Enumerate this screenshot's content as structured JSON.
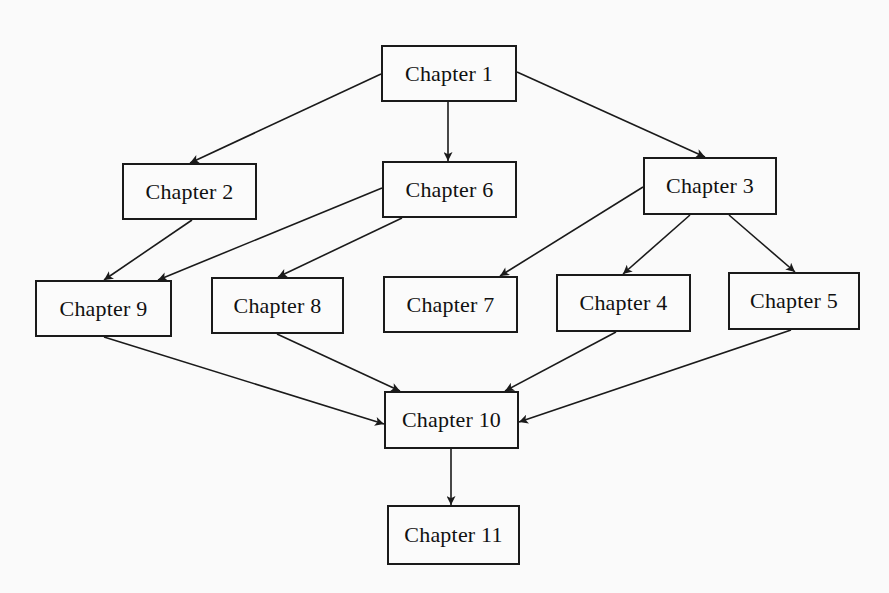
{
  "diagram": {
    "type": "dependency-graph",
    "colors": {
      "background": "#fafafa",
      "stroke": "#1a1a1a",
      "text": "#111111"
    },
    "nodes": [
      {
        "id": "ch1",
        "label": "Chapter 1",
        "x": 381,
        "y": 45,
        "w": 136,
        "h": 57
      },
      {
        "id": "ch2",
        "label": "Chapter 2",
        "x": 122,
        "y": 163,
        "w": 135,
        "h": 57
      },
      {
        "id": "ch6",
        "label": "Chapter 6",
        "x": 382,
        "y": 161,
        "w": 135,
        "h": 57
      },
      {
        "id": "ch3",
        "label": "Chapter 3",
        "x": 643,
        "y": 157,
        "w": 134,
        "h": 58
      },
      {
        "id": "ch9",
        "label": "Chapter 9",
        "x": 35,
        "y": 280,
        "w": 137,
        "h": 57
      },
      {
        "id": "ch8",
        "label": "Chapter 8",
        "x": 211,
        "y": 277,
        "w": 133,
        "h": 57
      },
      {
        "id": "ch7",
        "label": "Chapter 7",
        "x": 383,
        "y": 276,
        "w": 135,
        "h": 57
      },
      {
        "id": "ch4",
        "label": "Chapter 4",
        "x": 556,
        "y": 274,
        "w": 135,
        "h": 58
      },
      {
        "id": "ch5",
        "label": "Chapter 5",
        "x": 728,
        "y": 272,
        "w": 132,
        "h": 58
      },
      {
        "id": "ch10",
        "label": "Chapter 10",
        "x": 384,
        "y": 391,
        "w": 135,
        "h": 58
      },
      {
        "id": "ch11",
        "label": "Chapter 11",
        "x": 387,
        "y": 505,
        "w": 133,
        "h": 60
      }
    ],
    "edges": [
      {
        "from": "ch1",
        "to": "ch2",
        "x1": 381,
        "y1": 74,
        "x2": 190,
        "y2": 163
      },
      {
        "from": "ch1",
        "to": "ch6",
        "x1": 448,
        "y1": 102,
        "x2": 448,
        "y2": 161
      },
      {
        "from": "ch1",
        "to": "ch3",
        "x1": 517,
        "y1": 72,
        "x2": 705,
        "y2": 157
      },
      {
        "from": "ch2",
        "to": "ch9",
        "x1": 192,
        "y1": 220,
        "x2": 104,
        "y2": 280
      },
      {
        "from": "ch6",
        "to": "ch9",
        "x1": 382,
        "y1": 188,
        "x2": 158,
        "y2": 280
      },
      {
        "from": "ch6",
        "to": "ch8",
        "x1": 402,
        "y1": 218,
        "x2": 278,
        "y2": 277
      },
      {
        "from": "ch3",
        "to": "ch7",
        "x1": 643,
        "y1": 187,
        "x2": 500,
        "y2": 276
      },
      {
        "from": "ch3",
        "to": "ch4",
        "x1": 690,
        "y1": 215,
        "x2": 623,
        "y2": 274
      },
      {
        "from": "ch3",
        "to": "ch5",
        "x1": 729,
        "y1": 215,
        "x2": 795,
        "y2": 272
      },
      {
        "from": "ch9",
        "to": "ch10",
        "x1": 104,
        "y1": 337,
        "x2": 384,
        "y2": 424
      },
      {
        "from": "ch8",
        "to": "ch10",
        "x1": 277,
        "y1": 334,
        "x2": 400,
        "y2": 391
      },
      {
        "from": "ch4",
        "to": "ch10",
        "x1": 616,
        "y1": 332,
        "x2": 505,
        "y2": 391
      },
      {
        "from": "ch5",
        "to": "ch10",
        "x1": 791,
        "y1": 330,
        "x2": 519,
        "y2": 422
      },
      {
        "from": "ch10",
        "to": "ch11",
        "x1": 451,
        "y1": 449,
        "x2": 451,
        "y2": 505
      }
    ]
  }
}
